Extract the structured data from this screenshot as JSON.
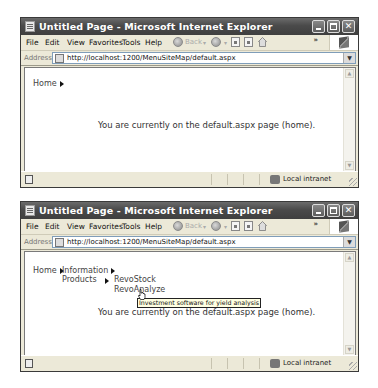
{
  "windows": [
    {
      "title": "Untitled Page - Microsoft Internet Explorer",
      "menu": [
        "File",
        "Edit",
        "View",
        "Favorites",
        "Tools",
        "Help"
      ],
      "menu_underline": [
        "F",
        "E",
        "V",
        "a",
        "T",
        "H"
      ],
      "toolbar": {
        "back_label": "Back",
        "chevron": "»"
      },
      "address": {
        "label": "Address",
        "url": "http://localhost:1200/MenuSiteMap/default.aspx"
      },
      "page": {
        "breadcrumb_home": "Home",
        "body_text": "You are currently on the default.aspx page (home)."
      },
      "status": {
        "zone": "Local intranet"
      }
    },
    {
      "title": "Untitled Page - Microsoft Internet Explorer",
      "menu": [
        "File",
        "Edit",
        "View",
        "Favorites",
        "Tools",
        "Help"
      ],
      "toolbar": {
        "back_label": "Back",
        "chevron": "»"
      },
      "address": {
        "label": "Address",
        "url": "http://localhost:1200/MenuSiteMap/default.aspx"
      },
      "page": {
        "menu_root": "Home",
        "submenu": [
          "Information",
          "Products"
        ],
        "products_submenu": [
          "RevoStock",
          "RevoAnalyze"
        ],
        "tooltip": "Investment software for yield analysis",
        "body_text": "You are currently on the default.aspx page (home)."
      },
      "status": {
        "zone": "Local intranet"
      }
    }
  ]
}
